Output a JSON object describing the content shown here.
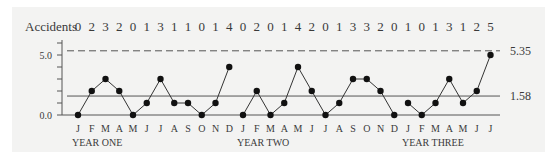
{
  "chart_data": {
    "type": "line",
    "title": "",
    "xlabel": "",
    "ylabel": "",
    "row_label": "Accidents",
    "ylim": [
      0,
      6
    ],
    "y_ticks": [
      "0.0",
      "5.0"
    ],
    "grid": false,
    "legend": null,
    "groups": [
      {
        "name": "YEAR ONE",
        "months": [
          "J",
          "F",
          "M",
          "A",
          "M",
          "J",
          "J",
          "A",
          "S",
          "O",
          "N",
          "D"
        ],
        "values": [
          0,
          2,
          3,
          2,
          0,
          1,
          3,
          1,
          1,
          0,
          1,
          4
        ]
      },
      {
        "name": "YEAR TWO",
        "months": [
          "J",
          "F",
          "M",
          "A",
          "M",
          "J",
          "J",
          "A",
          "S",
          "O",
          "N",
          "D"
        ],
        "values": [
          0,
          2,
          0,
          1,
          4,
          2,
          0,
          1,
          3,
          3,
          2,
          0
        ]
      },
      {
        "name": "YEAR THREE",
        "months": [
          "J",
          "F",
          "M",
          "A",
          "M",
          "J",
          "J"
        ],
        "values": [
          1,
          0,
          1,
          3,
          1,
          2,
          5
        ]
      }
    ],
    "reference_lines": [
      {
        "name": "upper-control-limit",
        "value": 5.35,
        "label": "5.35",
        "style": "dashed"
      },
      {
        "name": "center-line",
        "value": 1.58,
        "label": "1.58",
        "style": "solid"
      }
    ]
  }
}
